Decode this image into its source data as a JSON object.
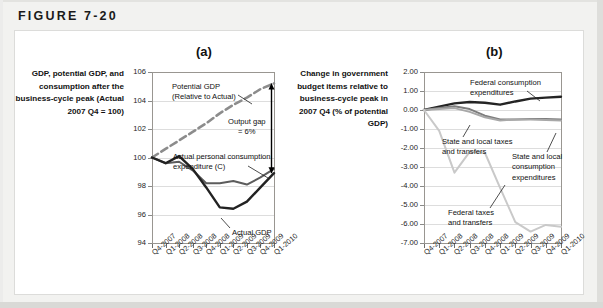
{
  "figure": {
    "label": "FIGURE 7-20"
  },
  "panel_a": {
    "title": "(a)",
    "axis_caption": "GDP, potential GDP, and consumption after the business-cycle peak (Actual 2007 Q4 = 100)",
    "annotations": [
      {
        "name": "potential-gdp-label",
        "text": "Potential GDP\n(Relative to Actual)"
      },
      {
        "name": "output-gap-label",
        "text": "Output gap\n= 6%"
      },
      {
        "name": "consumption-label",
        "text": "Actual personal consumption\nexpenditure (C)"
      },
      {
        "name": "actual-gdp-label",
        "text": "Actual GDP"
      }
    ]
  },
  "panel_b": {
    "title": "(b)",
    "axis_caption": "Change in government budget items relative to business-cycle peak in 2007 Q4 (% of potential GDP)",
    "annotations": [
      {
        "name": "federal-consumption-label",
        "text": "Federal consumption\nexpenditures"
      },
      {
        "name": "state-local-taxes-label",
        "text": "State and local taxes\nand transfers"
      },
      {
        "name": "state-local-consumption-label",
        "text": "State and local\nconsumption\nexpenditures"
      },
      {
        "name": "federal-taxes-label",
        "text": "Federal taxes\nand transfers"
      }
    ]
  },
  "chart_data": [
    {
      "id": "panel_a",
      "type": "line",
      "title": "(a)",
      "ylabel": "GDP, potential GDP, and consumption after the business-cycle peak (Actual 2007 Q4 = 100)",
      "xlabel": "",
      "ylim": [
        94,
        106
      ],
      "yticks": [
        94,
        96,
        98,
        100,
        102,
        104,
        106
      ],
      "ytick_labels": [
        "94",
        "96",
        "98",
        "100",
        "102",
        "104",
        "106"
      ],
      "grid": true,
      "legend": "inline-annotations",
      "categories": [
        "Q4-2007",
        "Q1-2008",
        "Q2-2008",
        "Q3-2008",
        "Q4-2008",
        "Q1-2009",
        "Q2-2009",
        "Q3-2009",
        "Q4-2009",
        "Q1-2010"
      ],
      "series": [
        {
          "name": "Potential GDP (Relative to Actual)",
          "style": "dashed",
          "color": "#8c8c8c",
          "values": [
            100.0,
            100.6,
            101.2,
            101.8,
            102.4,
            103.1,
            103.7,
            104.2,
            104.8,
            105.2
          ]
        },
        {
          "name": "Actual personal consumption expenditure (C)",
          "style": "solid",
          "color": "#5c5c5c",
          "values": [
            100.0,
            99.6,
            99.7,
            99.1,
            98.2,
            98.2,
            98.35,
            98.1,
            98.6,
            99.2
          ]
        },
        {
          "name": "Actual GDP",
          "style": "solid",
          "color": "#222222",
          "values": [
            100.0,
            99.6,
            100.1,
            99.2,
            97.9,
            96.5,
            96.4,
            96.9,
            97.9,
            98.9
          ]
        }
      ],
      "annotations": [
        {
          "text": "Potential GDP (Relative to Actual)",
          "target": "Potential GDP"
        },
        {
          "text": "Output gap = 6%",
          "target": "gap between Potential GDP and Actual GDP at Q1-2010",
          "value": 6
        },
        {
          "text": "Actual personal consumption expenditure (C)",
          "target": "Actual personal consumption expenditure (C)"
        },
        {
          "text": "Actual GDP",
          "target": "Actual GDP"
        }
      ]
    },
    {
      "id": "panel_b",
      "type": "line",
      "title": "(b)",
      "ylabel": "Change in government budget items relative to business-cycle peak in 2007 Q4 (% of potential GDP)",
      "xlabel": "",
      "ylim": [
        -7.0,
        2.0
      ],
      "yticks": [
        2.0,
        1.0,
        0.0,
        -1.0,
        -2.0,
        -3.0,
        -4.0,
        -5.0,
        -6.0,
        -7.0
      ],
      "ytick_labels": [
        "2.00",
        "1.00",
        "0.00",
        "-1.00",
        "-2.00",
        "-3.00",
        "-4.00",
        "-5.00",
        "-6.00",
        "-7.00"
      ],
      "grid": true,
      "legend": "inline-annotations",
      "categories": [
        "Q4-2007",
        "Q1-2008",
        "Q2-2008",
        "Q3-2008",
        "Q4-2008",
        "Q1-2009",
        "Q2-2009",
        "Q3-2009",
        "Q4-2009",
        "Q1-2010"
      ],
      "series": [
        {
          "name": "Federal consumption expenditures",
          "style": "solid",
          "color": "#242424",
          "values": [
            0.0,
            0.18,
            0.35,
            0.42,
            0.38,
            0.28,
            0.45,
            0.6,
            0.65,
            0.7
          ]
        },
        {
          "name": "State and local taxes and transfers",
          "style": "solid",
          "color": "#7d7d7d",
          "values": [
            0.0,
            0.1,
            0.2,
            0.05,
            -0.3,
            -0.5,
            -0.5,
            -0.48,
            -0.48,
            -0.5
          ]
        },
        {
          "name": "State and local consumption expenditures",
          "style": "solid",
          "color": "#a8a8a8",
          "values": [
            0.0,
            0.05,
            0.1,
            -0.1,
            -0.38,
            -0.55,
            -0.5,
            -0.5,
            -0.52,
            -0.55
          ]
        },
        {
          "name": "Federal taxes and transfers",
          "style": "solid",
          "color": "#c9c9c9",
          "values": [
            0.0,
            -1.1,
            -3.3,
            -2.2,
            -2.25,
            -4.1,
            -5.9,
            -6.4,
            -6.05,
            -6.15
          ]
        }
      ],
      "annotations": [
        {
          "text": "Federal consumption expenditures",
          "target": "Federal consumption expenditures"
        },
        {
          "text": "State and local taxes and transfers",
          "target": "State and local taxes and transfers"
        },
        {
          "text": "State and local consumption expenditures",
          "target": "State and local consumption expenditures"
        },
        {
          "text": "Federal taxes and transfers",
          "target": "Federal taxes and transfers"
        }
      ]
    }
  ]
}
